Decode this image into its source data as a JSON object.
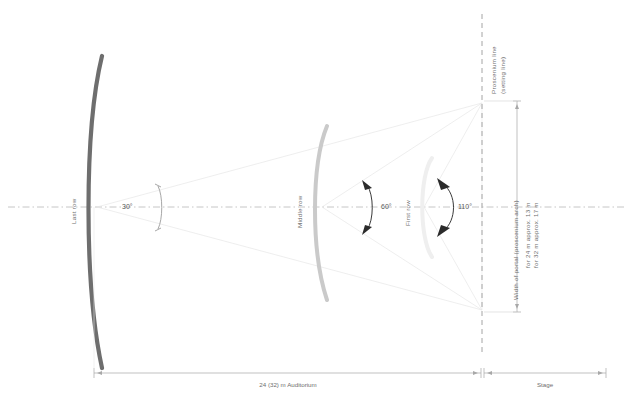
{
  "diagram": {
    "rows": [
      {
        "id": "last-row",
        "label": "Last row",
        "angle": "30°",
        "color": "#6e6e6e"
      },
      {
        "id": "middle-row",
        "label": "Middle row",
        "angle": "60°",
        "color": "#c9c9c9"
      },
      {
        "id": "first-row",
        "label": "First row",
        "angle": "110°",
        "color": "#eeeeee"
      }
    ],
    "proscenium": {
      "line_label_1": "Proscenium line",
      "line_label_2": "(setting line)"
    },
    "portal_dimension": {
      "title": "Width of portal (proscenium arch)",
      "note_1": "for 24 m approx. 13 m",
      "note_2": "for 32 m approx. 17 m"
    },
    "bottom_dimensions": [
      {
        "id": "auditorium",
        "label": "24 (32) m Auditorium"
      },
      {
        "id": "stage",
        "label": "Stage"
      }
    ],
    "colors": {
      "dark_arc": "#6e6e6e",
      "mid_arc": "#c9c9c9",
      "light_arc": "#eeeeee",
      "ray": "#e4e4e4",
      "centerline": "#b5b5b5",
      "dim": "#a8a8a8",
      "arrowhead": "#2b2b2b",
      "text": "#6e6e6e"
    }
  }
}
